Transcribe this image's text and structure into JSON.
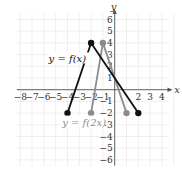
{
  "chart_data": {
    "type": "line",
    "title": "",
    "xlabel": "x",
    "ylabel": "y",
    "xlim": [
      -8,
      4
    ],
    "ylim": [
      -6,
      6
    ],
    "grid": true,
    "x_ticks": [
      "−8",
      "−7",
      "−6",
      "−5",
      "−4",
      "−3",
      "−2",
      "−1",
      "2",
      "3",
      "4"
    ],
    "y_ticks": [
      "6",
      "5",
      "4",
      "3",
      "2",
      "1",
      "−1",
      "−2",
      "−3",
      "−4",
      "−5",
      "−6"
    ],
    "series": [
      {
        "name": "y = f(x)",
        "color": "#111111",
        "points": [
          [
            -4,
            -2
          ],
          [
            -2,
            4
          ],
          [
            2,
            -2
          ]
        ]
      },
      {
        "name": "y = f(2x)",
        "color": "#8c8c8c",
        "points": [
          [
            -2,
            -2
          ],
          [
            -1,
            4
          ],
          [
            1,
            -2
          ]
        ]
      }
    ],
    "annotations": [
      {
        "text": "y = f(x)",
        "x": -5.5,
        "y": 2.5
      },
      {
        "text": "y = f(2x)",
        "x": -3.7,
        "y": -2.9
      }
    ]
  },
  "labels": {
    "x_axis": "x",
    "y_axis": "y",
    "f_label": "y = f(x)",
    "f2_label": "y = f(2x)"
  }
}
